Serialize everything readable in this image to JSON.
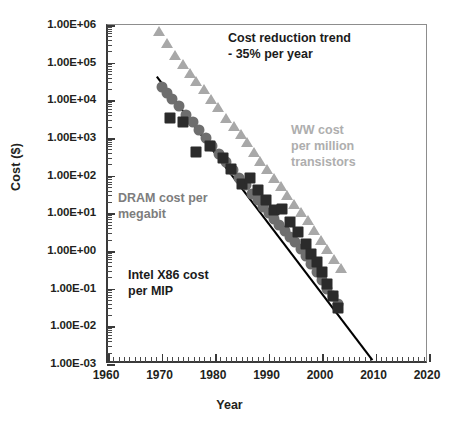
{
  "chart_data": {
    "type": "scatter",
    "title": "",
    "xlabel": "Year",
    "ylabel": "Cost ($)",
    "xlim": [
      1960,
      2020
    ],
    "ylim": [
      0.001,
      1000000
    ],
    "yscale": "log",
    "xticks": [
      "1960",
      "1970",
      "1980",
      "1990",
      "2000",
      "2010",
      "2020"
    ],
    "yticks": [
      "1.00E+06",
      "1.00E+05",
      "1.00E+04",
      "1.00E+03",
      "1.00E+02",
      "1.00E+01",
      "1.00E+00",
      "1.00E-01",
      "1.00E-02",
      "1.00E-03"
    ],
    "grid": false,
    "legend_position": "inline-annotations",
    "series": [
      {
        "name": "WW cost per million transistors",
        "marker": "triangle",
        "color": "#a8a8a8",
        "points": [
          [
            1969.5,
            700000
          ],
          [
            1971.0,
            330000
          ],
          [
            1972.5,
            160000
          ],
          [
            1974.0,
            90000
          ],
          [
            1975.3,
            52000
          ],
          [
            1976.5,
            33000
          ],
          [
            1978.0,
            20000
          ],
          [
            1979.3,
            11000
          ],
          [
            1980.5,
            6500
          ],
          [
            1982.0,
            3300
          ],
          [
            1983.5,
            2100
          ],
          [
            1984.8,
            1300
          ],
          [
            1986.0,
            780
          ],
          [
            1987.3,
            430
          ],
          [
            1988.5,
            250
          ],
          [
            1989.8,
            150
          ],
          [
            1991.0,
            88
          ],
          [
            1992.3,
            52
          ],
          [
            1993.5,
            31
          ],
          [
            1994.8,
            18
          ],
          [
            1996.0,
            11
          ],
          [
            1997.3,
            6.5
          ],
          [
            1998.5,
            3.6
          ],
          [
            1999.8,
            2.0
          ],
          [
            2001.0,
            1.1
          ],
          [
            2002.3,
            0.62
          ],
          [
            2003.5,
            0.35
          ]
        ]
      },
      {
        "name": "DRAM cost per megabit",
        "marker": "circle",
        "color": "#6e6e6e",
        "points": [
          [
            1970.0,
            22000
          ],
          [
            1971.0,
            16000
          ],
          [
            1972.0,
            11000
          ],
          [
            1973.2,
            7000
          ],
          [
            1974.5,
            4200
          ],
          [
            1975.8,
            2600
          ],
          [
            1977.0,
            1600
          ],
          [
            1978.3,
            1000
          ],
          [
            1979.5,
            620
          ],
          [
            1980.8,
            380
          ],
          [
            1982.0,
            230
          ],
          [
            1983.3,
            140
          ],
          [
            1984.5,
            88
          ],
          [
            1985.8,
            55
          ],
          [
            1987.0,
            33
          ],
          [
            1988.0,
            22
          ],
          [
            1989.0,
            15
          ],
          [
            1990.0,
            10
          ],
          [
            1991.0,
            7.0
          ],
          [
            1992.0,
            5.0
          ],
          [
            1993.0,
            3.4
          ],
          [
            1994.0,
            2.4
          ],
          [
            1995.0,
            1.7
          ],
          [
            1996.0,
            1.1
          ],
          [
            1997.0,
            0.72
          ],
          [
            1998.0,
            0.45
          ],
          [
            1999.0,
            0.28
          ],
          [
            2000.0,
            0.17
          ],
          [
            2001.0,
            0.1
          ],
          [
            2002.0,
            0.062
          ],
          [
            2003.0,
            0.038
          ]
        ]
      },
      {
        "name": "Intel X86 cost per MIP",
        "marker": "square",
        "color": "#2b2b2b",
        "points": [
          [
            1971.5,
            3300
          ],
          [
            1974.0,
            2600
          ],
          [
            1976.5,
            430
          ],
          [
            1979.0,
            600
          ],
          [
            1981.5,
            300
          ],
          [
            1983.0,
            150
          ],
          [
            1985.0,
            60
          ],
          [
            1986.5,
            88
          ],
          [
            1988.0,
            42
          ],
          [
            1989.5,
            22
          ],
          [
            1991.0,
            12
          ],
          [
            1992.5,
            13
          ],
          [
            1994.0,
            6.0
          ],
          [
            1995.5,
            3.2
          ],
          [
            1997.0,
            1.5
          ],
          [
            1998.0,
            0.85
          ],
          [
            1999.0,
            0.5
          ],
          [
            2000.0,
            0.27
          ],
          [
            2001.0,
            0.13
          ],
          [
            2002.0,
            0.065
          ],
          [
            2003.0,
            0.03
          ]
        ]
      }
    ],
    "trendline": {
      "label": "Cost reduction trend - 35% per year",
      "color": "#000000",
      "from": [
        1969.5,
        40000
      ],
      "to": [
        2009.8,
        0.0012
      ]
    },
    "annotations": [
      {
        "id": "trend-note",
        "text": "Cost reduction trend\n- 35% per year",
        "color": "#1b1b1b"
      },
      {
        "id": "ww-note",
        "text": "WW cost\nper million\ntransistors",
        "color": "#aeaeae"
      },
      {
        "id": "dram-note",
        "text": "DRAM cost per\nmegabit",
        "color": "#7d7d7d"
      },
      {
        "id": "intel-note",
        "text": "Intel X86 cost\nper MIP",
        "color": "#1b1b1b"
      }
    ]
  },
  "caption": {
    "text": ""
  }
}
